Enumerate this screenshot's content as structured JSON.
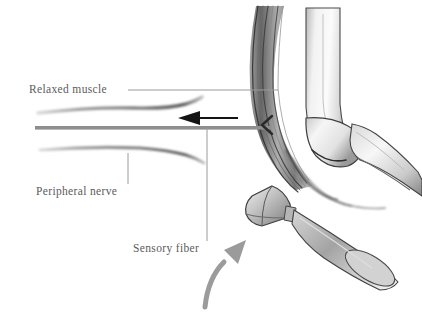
{
  "figure": {
    "background_color": "#ffffff",
    "width": 422,
    "height": 317
  },
  "labels": {
    "relaxed_muscle": "Relaxed muscle",
    "peripheral_nerve": "Peripheral nerve",
    "sensory_fiber": "Sensory fiber"
  },
  "colors": {
    "label_text": "#5b5b5b",
    "leader_line": "#9a9a9a",
    "nerve_bar": "#8e8e8e",
    "black_arrow": "#141414",
    "curved_arrow": "#9b9b9b",
    "pencil_dark": "#3a3a3a",
    "pencil_mid": "#8d8d8d",
    "pencil_light": "#cfcfcf"
  },
  "annotations": {
    "black_arrow_direction": "left",
    "curved_arrow_direction": "up-right",
    "black_arrow_meaning": "impulse travels along nerve away from muscle",
    "curved_arrow_meaning": "reflex hammer strike direction"
  },
  "illustration_parts": {
    "muscle": "relaxed-muscle",
    "humerus": "upper-arm-bone",
    "forearm": "forearm-bone",
    "elbow_joint": "elbow-joint",
    "reflex_hammer": "reflex-hammer",
    "nerve_upper": "peripheral-nerve-upper-strand",
    "nerve_lower": "peripheral-nerve-lower-strand",
    "nerve_trunk": "nerve-trunk-bar"
  }
}
